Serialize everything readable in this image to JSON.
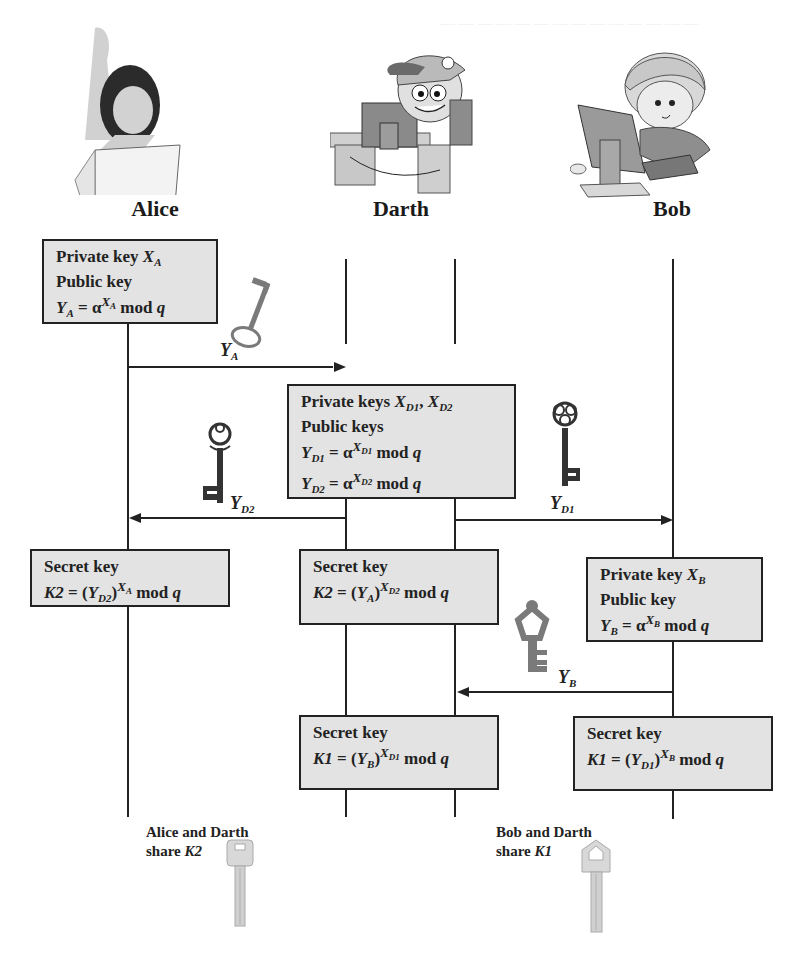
{
  "parties": {
    "alice": {
      "name": "Alice"
    },
    "darth": {
      "name": "Darth"
    },
    "bob": {
      "name": "Bob"
    }
  },
  "boxes": {
    "alice_keys": {
      "line1_text": "Private key ",
      "line1_var": "X",
      "line1_sub": "A",
      "line2_text": "Public key",
      "line3_lhs": "Y",
      "line3_lhs_sub": "A",
      "line3_eq": " = α",
      "line3_exp": "X",
      "line3_exp_sub": "A",
      "line3_tail": " mod ",
      "line3_q": "q"
    },
    "darth_keys": {
      "line1_text": "Private keys ",
      "line1_var1": "X",
      "line1_sub1": "D1",
      "line1_sep": ", ",
      "line1_var2": "X",
      "line1_sub2": "D2",
      "line2_text": "Public keys",
      "line3_lhs": "Y",
      "line3_lhs_sub": "D1",
      "line3_eq": " = α",
      "line3_exp": "X",
      "line3_exp_sub": "D1",
      "line3_tail": " mod ",
      "line3_q": "q",
      "line4_lhs": "Y",
      "line4_lhs_sub": "D2",
      "line4_eq": " = α",
      "line4_exp": "X",
      "line4_exp_sub": "D2",
      "line4_tail": " mod ",
      "line4_q": "q"
    },
    "alice_secret": {
      "title": "Secret key",
      "lhs": "K2",
      "eq": " = (",
      "base": "Y",
      "base_sub": "D2",
      "close": ")",
      "exp": "X",
      "exp_sub": "A",
      "tail": " mod ",
      "q": "q"
    },
    "darth_secret_k2": {
      "title": "Secret key",
      "lhs": "K2",
      "eq": " = (",
      "base": "Y",
      "base_sub": "A",
      "close": ")",
      "exp": "X",
      "exp_sub": "D2",
      "tail": " mod ",
      "q": "q"
    },
    "bob_keys": {
      "line1_text": "Private key ",
      "line1_var": "X",
      "line1_sub": "B",
      "line2_text": "Public key",
      "line3_lhs": "Y",
      "line3_lhs_sub": "B",
      "line3_eq": " = α",
      "line3_exp": "X",
      "line3_exp_sub": "B",
      "line3_tail": " mod ",
      "line3_q": "q"
    },
    "darth_secret_k1": {
      "title": "Secret key",
      "lhs": "K1",
      "eq": " = (",
      "base": "Y",
      "base_sub": "B",
      "close": ")",
      "exp": "X",
      "exp_sub": "D1",
      "tail": " mod ",
      "q": "q"
    },
    "bob_secret": {
      "title": "Secret key",
      "lhs": "K1",
      "eq": " = (",
      "base": "Y",
      "base_sub": "D1",
      "close": ")",
      "exp": "X",
      "exp_sub": "B",
      "tail": " mod ",
      "q": "q"
    }
  },
  "messages": {
    "ya": {
      "var": "Y",
      "sub": "A",
      "icon": "key-icon"
    },
    "yd2": {
      "var": "Y",
      "sub": "D2",
      "icon": "key-icon"
    },
    "yd1": {
      "var": "Y",
      "sub": "D1",
      "icon": "key-icon"
    },
    "yb": {
      "var": "Y",
      "sub": "B",
      "icon": "key-icon"
    }
  },
  "shared": {
    "k2": {
      "line1": "Alice and Darth",
      "line2_text": "share ",
      "line2_key": "K2"
    },
    "k1": {
      "line1": "Bob and Darth",
      "line2_text": "share ",
      "line2_key": "K1"
    }
  },
  "colors": {
    "box_fill": "#e3e3e3",
    "line": "#222222",
    "key_dark": "#333333",
    "key_gray": "#7a7a7a",
    "key_light": "#d0d0d0"
  }
}
